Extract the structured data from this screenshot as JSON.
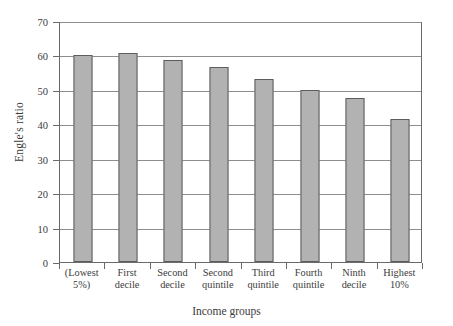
{
  "chart_data": {
    "type": "bar",
    "title": "",
    "xlabel": "Income groups",
    "ylabel": "Engle's ratio",
    "categories": [
      "(Lowest 5%)",
      "First decile",
      "Second decile",
      "Second quintile",
      "Third quintile",
      "Fourth quintile",
      "Ninth decile",
      "Highest 10%"
    ],
    "category_lines": [
      [
        "(Lowest",
        "5%)"
      ],
      [
        "First",
        "decile"
      ],
      [
        "Second",
        "decile"
      ],
      [
        "Second",
        "quintile"
      ],
      [
        "Third",
        "quintile"
      ],
      [
        "Fourth",
        "quintile"
      ],
      [
        "Ninth",
        "decile"
      ],
      [
        "Highest",
        "10%"
      ]
    ],
    "values": [
      60.0,
      60.7,
      58.8,
      56.5,
      53.2,
      50.0,
      47.6,
      41.4
    ],
    "ylim": [
      0,
      70
    ],
    "yticks": [
      0,
      10,
      20,
      30,
      40,
      50,
      60,
      70
    ],
    "ytick_labels": [
      "0",
      "10",
      "20",
      "30",
      "40",
      "50",
      "60",
      "70"
    ],
    "grid": true,
    "grid_axis": "y",
    "legend": false,
    "bar_fill_color": "#b2b2b2",
    "bar_border_color": "#5d5d5d",
    "grid_color": "#8d8d8d",
    "axis_color": "#6a6a6a",
    "background_color": "#ffffff"
  }
}
